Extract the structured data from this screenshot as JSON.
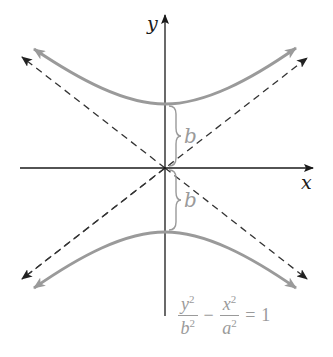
{
  "diagram": {
    "type": "hyperbola",
    "axis_labels": {
      "x": "x",
      "y": "y"
    },
    "distance_labels": {
      "upper": "b",
      "lower": "b"
    },
    "equation": {
      "term1_num": "y",
      "term1_num_exp": "2",
      "term1_den": "b",
      "term1_den_exp": "2",
      "operator": "−",
      "term2_num": "x",
      "term2_num_exp": "2",
      "term2_den": "a",
      "term2_den_exp": "2",
      "equals": "=",
      "rhs": "1"
    },
    "colors": {
      "axes": "#1a1a1a",
      "asymptotes": "#333333",
      "curve": "#9a9a9a",
      "annotation": "#9a9a9a"
    }
  }
}
